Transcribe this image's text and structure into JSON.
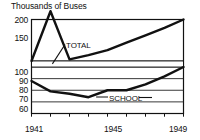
{
  "chart_data": {
    "type": "line",
    "title": "Thousands of Buses",
    "xlabel": "",
    "ylabel": "",
    "grid": true,
    "legend_position": "inline-annotations",
    "axis_break": true,
    "x": [
      1941,
      1942,
      1943,
      1944,
      1945,
      1946,
      1947,
      1948,
      1949
    ],
    "xlim": [
      1941,
      1949
    ],
    "xticks": [
      1941,
      1942,
      1943,
      1944,
      1945,
      1946,
      1947,
      1948,
      1949
    ],
    "xtick_labels": [
      "1941",
      "",
      "",
      "",
      "1945",
      "",
      "",
      "",
      "1949"
    ],
    "yticks_upper": [
      150,
      200
    ],
    "yticks_lower": [
      60,
      70,
      80,
      90,
      100
    ],
    "ylim_upper": [
      150,
      200
    ],
    "ylim_lower": [
      60,
      100
    ],
    "series": [
      {
        "name": "TOTAL",
        "values": [
          150,
          148,
          152,
          157,
          163,
          172,
          181,
          190,
          200
        ]
      },
      {
        "name": "SCHOOL",
        "values": [
          88,
          79,
          77,
          74,
          80,
          80,
          85,
          92,
          100
        ]
      }
    ],
    "annotations": [
      {
        "text": "TOTAL",
        "series": "TOTAL"
      },
      {
        "text": "SCHOOL",
        "series": "SCHOOL"
      }
    ],
    "colors": {
      "line": "#111111",
      "grid": "#222222",
      "axis": "#111111",
      "background": "#ffffff"
    }
  }
}
